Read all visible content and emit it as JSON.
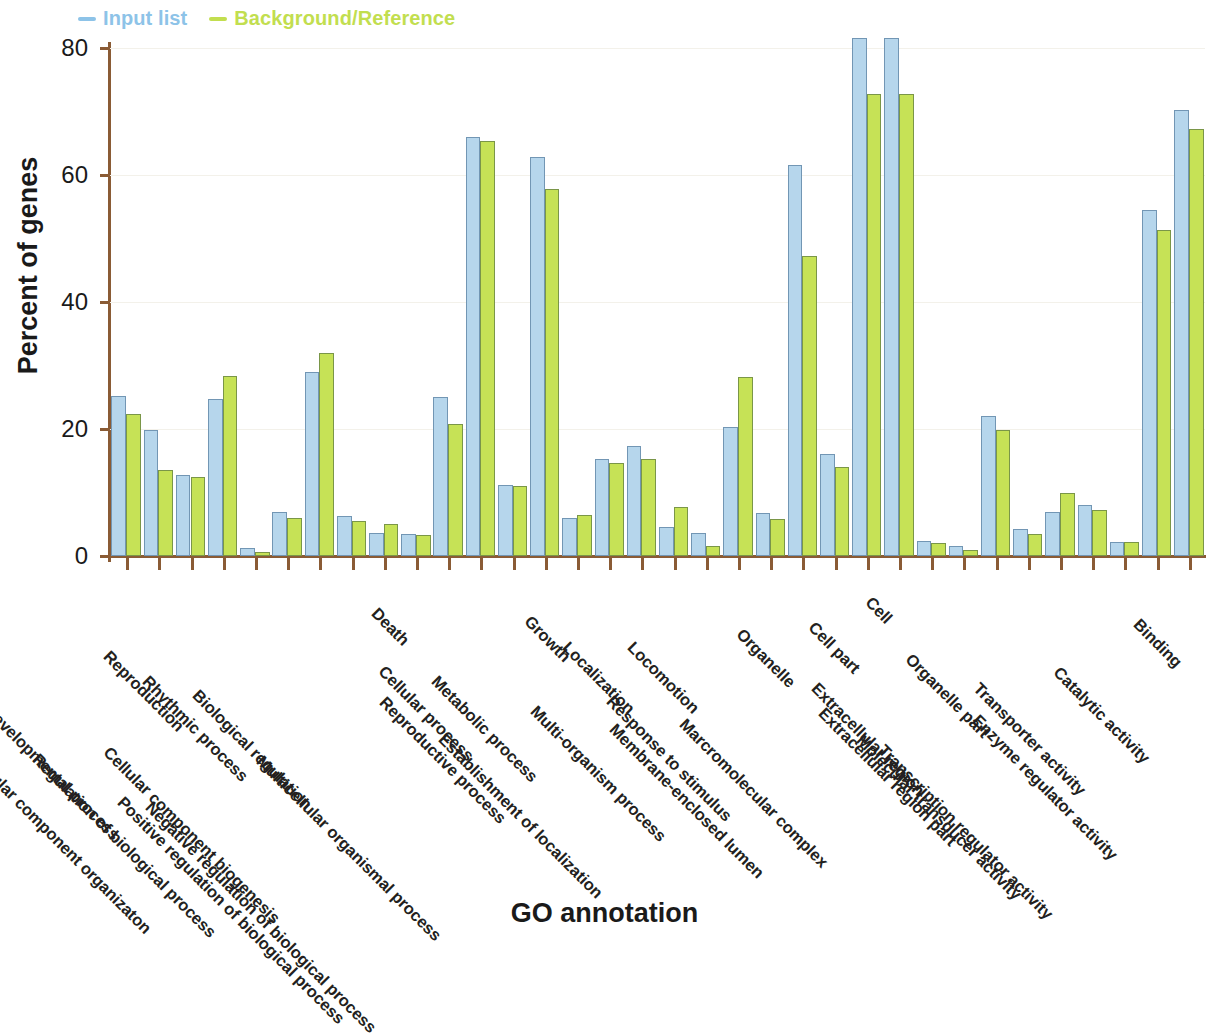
{
  "legend": {
    "position": "top-left",
    "items": [
      {
        "label": "Input list",
        "color": "#8dc3e8",
        "marker": "dash"
      },
      {
        "label": "Background/Reference",
        "color": "#c2de4f",
        "marker": "dash"
      }
    ]
  },
  "axes": {
    "y_title": "Percent of genes",
    "x_title": "GO annotation",
    "y_ticks": [
      "0",
      "20",
      "40",
      "60",
      "80"
    ]
  },
  "chart_data": {
    "type": "bar",
    "title": "",
    "subtitle": "",
    "xlabel": "GO annotation",
    "ylabel": "Percent of genes",
    "ylim": [
      0,
      80
    ],
    "yticks": [
      0,
      20,
      40,
      60,
      80
    ],
    "grid": false,
    "legend_position": "top-left",
    "orientation": "vertical",
    "grouped": true,
    "categories": [
      "Developmental process",
      "Cellular component organizaton",
      "Reproduction",
      "Regulation of biological process",
      "Rhythmic process",
      "Cellular component biogenesis",
      "Biological regulation",
      "Positive regulation of biological process",
      "Negative regulation of biological process",
      "Death",
      "Multicellular organismal process",
      "Cellular process",
      "Reproductive process",
      "Metabolic process",
      "Growth",
      "Establishment of localization",
      "Localization",
      "Multi-organism process",
      "Locomotion",
      "Response to stimulus",
      "Membrane-enclosed lumen",
      "Organelle",
      "Marcromolecular complex",
      "Cell part",
      "Cell",
      "Extracellular region",
      "Extracellular region part",
      "Organelle part",
      "Molecular transducer activity",
      "Transcription regulator activity",
      "Transporter activity",
      "Enzyme regulator activity",
      "Catalytic activity",
      "Binding"
    ],
    "series": [
      {
        "name": "Input list",
        "color": "#b6d6ec",
        "values": [
          25.2,
          19.8,
          12.7,
          24.8,
          1.3,
          7.0,
          29.0,
          6.3,
          3.7,
          3.5,
          25.0,
          66.0,
          11.2,
          62.8,
          6.0,
          15.3,
          17.3,
          4.5,
          3.7,
          20.3,
          6.8,
          61.5,
          16.0,
          81.5,
          81.5,
          2.3,
          1.5,
          22.0,
          4.2,
          7.0,
          8.0,
          2.2,
          54.5,
          70.3
        ]
      },
      {
        "name": "Background/Reference",
        "color": "#c6e256",
        "values": [
          22.4,
          13.5,
          12.5,
          28.3,
          0.7,
          6.0,
          32.0,
          5.5,
          5.0,
          3.3,
          20.8,
          65.4,
          11.0,
          57.8,
          6.5,
          14.7,
          15.3,
          7.7,
          1.5,
          28.2,
          5.8,
          47.3,
          14.0,
          72.8,
          72.8,
          2.0,
          1.0,
          19.8,
          3.5,
          10.0,
          7.3,
          2.2,
          51.3,
          67.3
        ]
      }
    ]
  }
}
